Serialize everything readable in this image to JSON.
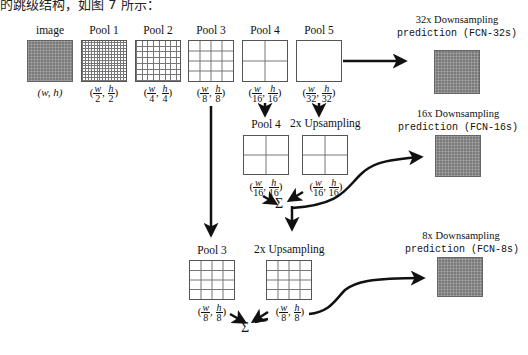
{
  "caption_top": "的跳级结构，如图 7 所示：",
  "row1": {
    "image": {
      "label": "image",
      "dims": "(w, h)"
    },
    "pools": [
      {
        "label": "Pool 1",
        "w_num": "w",
        "w_den": "2",
        "h_num": "h",
        "h_den": "2"
      },
      {
        "label": "Pool 2",
        "w_num": "w",
        "w_den": "4",
        "h_num": "h",
        "h_den": "4"
      },
      {
        "label": "Pool 3",
        "w_num": "w",
        "w_den": "8",
        "h_num": "h",
        "h_den": "8"
      },
      {
        "label": "Pool 4",
        "w_num": "w",
        "w_den": "16",
        "h_num": "h",
        "h_den": "16"
      },
      {
        "label": "Pool 5",
        "w_num": "w",
        "w_den": "32",
        "h_num": "h",
        "h_den": "32"
      }
    ]
  },
  "predictions": [
    {
      "line1": "32x Downsampling",
      "line2": "prediction (FCN-32s)"
    },
    {
      "line1": "16x Downsampling",
      "line2": "prediction (FCN-16s)"
    },
    {
      "line1": "8x Downsampling",
      "line2": "prediction (FCN-8s)"
    }
  ],
  "row2": {
    "pool": {
      "label": "Pool 4",
      "w_num": "w",
      "w_den": "16",
      "h_num": "h",
      "h_den": "16"
    },
    "up": {
      "label": "2x Upsampling",
      "w_num": "w",
      "w_den": "16",
      "h_num": "h",
      "h_den": "16"
    },
    "sum": "Σ"
  },
  "row3": {
    "pool": {
      "label": "Pool 3",
      "w_num": "w",
      "w_den": "8",
      "h_num": "h",
      "h_den": "8"
    },
    "up": {
      "label": "2x Upsampling",
      "w_num": "w",
      "w_den": "8",
      "h_num": "h",
      "h_den": "8"
    },
    "sum": "Σ"
  },
  "colors": {
    "prediction_fill": "#7a7a7a",
    "grid_line": "#777777",
    "arrow": "#111111"
  }
}
